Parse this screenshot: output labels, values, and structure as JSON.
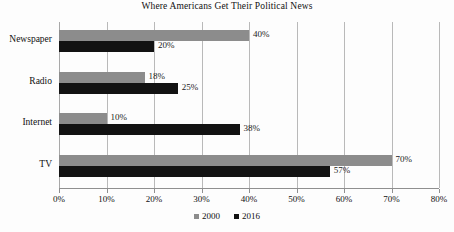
{
  "chart_data": {
    "type": "bar",
    "orientation": "horizontal",
    "title": "Where Americans Get Their Political News",
    "xlabel": "",
    "ylabel": "",
    "categories": [
      "Newspaper",
      "Radio",
      "Internet",
      "TV"
    ],
    "series": [
      {
        "name": "2000",
        "color": "#8c8c8c",
        "values": [
          40,
          18,
          10,
          70
        ]
      },
      {
        "name": "2016",
        "color": "#121212",
        "values": [
          20,
          25,
          38,
          57
        ]
      }
    ],
    "value_labels": [
      [
        "40%",
        "18%",
        "10%",
        "70%"
      ],
      [
        "20%",
        "25%",
        "38%",
        "57%"
      ]
    ],
    "xlim": [
      0,
      80
    ],
    "xticks": [
      0,
      10,
      20,
      30,
      40,
      50,
      60,
      70,
      80
    ],
    "xtick_labels": [
      "0%",
      "10%",
      "20%",
      "30%",
      "40%",
      "50%",
      "60%",
      "70%",
      "80%"
    ],
    "grid": true,
    "legend_position": "bottom"
  }
}
